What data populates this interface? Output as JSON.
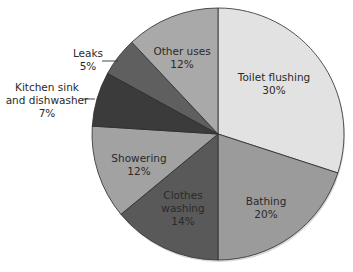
{
  "chart_data": {
    "type": "pie",
    "title": "",
    "start_angle_deg": 0,
    "direction": "clockwise",
    "center": [
      218,
      134
    ],
    "radius": 126,
    "slices": [
      {
        "label": "Toilet flushing",
        "value": 30,
        "pct_text": "30%",
        "color": "#e2e2e2",
        "label_pos": [
          274,
          84
        ],
        "label_lines": [
          "Toilet flushing",
          "30%"
        ],
        "leader": false
      },
      {
        "label": "Bathing",
        "value": 20,
        "pct_text": "20%",
        "color": "#9b9b9b",
        "label_pos": [
          266,
          208
        ],
        "label_lines": [
          "Bathing",
          "20%"
        ],
        "leader": false
      },
      {
        "label": "Clothes washing",
        "value": 14,
        "pct_text": "14%",
        "color": "#595959",
        "label_pos": [
          183,
          208
        ],
        "label_lines": [
          "Clothes",
          "washing",
          "14%"
        ],
        "leader": false
      },
      {
        "label": "Showering",
        "value": 12,
        "pct_text": "12%",
        "color": "#a2a2a2",
        "label_pos": [
          139,
          165
        ],
        "label_lines": [
          "Showering",
          "12%"
        ],
        "leader": false
      },
      {
        "label": "Kitchen sink and dishwasher",
        "value": 7,
        "pct_text": "7%",
        "color": "#3b3b3b",
        "label_pos": [
          47,
          100
        ],
        "label_lines": [
          "Kitchen sink",
          "and dishwasher",
          "7%"
        ],
        "leader": true,
        "leader_line": [
          82,
          99,
          95,
          99
        ]
      },
      {
        "label": "Leaks",
        "value": 5,
        "pct_text": "5%",
        "color": "#5f5f5f",
        "label_pos": [
          88,
          60
        ],
        "label_lines": [
          "Leaks",
          "5%"
        ],
        "leader": true,
        "leader_line": [
          102,
          61,
          118,
          61
        ]
      },
      {
        "label": "Other uses",
        "value": 12,
        "pct_text": "12%",
        "color": "#a9a9a9",
        "label_pos": [
          182,
          58
        ],
        "label_lines": [
          "Other uses",
          "12%"
        ],
        "leader": false
      }
    ],
    "legend": "none",
    "stroke_color": "#2b2b2b"
  }
}
